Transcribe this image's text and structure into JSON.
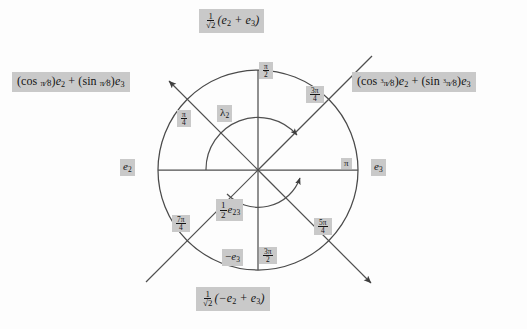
{
  "figure": {
    "type": "unit-circle-rotation-diagram",
    "center": {
      "x": 258,
      "y": 170
    },
    "radius": 100,
    "stroke_color": "#4a4a4a",
    "label_background": "#c9c9c9",
    "label_text_color": "#141414"
  },
  "outer_labels": {
    "top": {
      "text": "1/sqrt(2) (e2 + e3)",
      "coefficient_num": "1",
      "coefficient_den": "2",
      "body": "(e2 + e3)",
      "angle": "pi/4"
    },
    "left": {
      "text": "(cos pi/8)e2 + (sin pi/8)e3",
      "cos_arg": "pi/8",
      "sin_arg": "pi/8",
      "angle": "pi/8"
    },
    "right": {
      "text": "(cos 3pi/8)e2 + (sin 3pi/8)e3",
      "cos_arg": "3pi/8",
      "sin_arg": "3pi/8",
      "angle": "3pi/8"
    },
    "bottom": {
      "text": "1/sqrt(2) (-e2 + e3)",
      "coefficient_num": "1",
      "coefficient_den": "2",
      "body": "(-e2 + e3)",
      "angle": "3pi/4"
    }
  },
  "axis_labels": {
    "left_basis": "e2",
    "left_basis_sub": "2",
    "right_basis": "e3",
    "right_basis_sub": "3",
    "bottom_basis": "-e3",
    "bottom_basis_sub": "3"
  },
  "angle_ticks": [
    {
      "name": "pi-over-2",
      "num": "π",
      "den": "2",
      "degrees": 90,
      "position": "top"
    },
    {
      "name": "3pi-over-4",
      "num": "3π",
      "den": "4",
      "degrees": 135,
      "position": "upper-right"
    },
    {
      "name": "pi-over-4",
      "num": "π",
      "den": "4",
      "degrees": 45,
      "position": "upper-left"
    },
    {
      "name": "pi",
      "num": "π",
      "den": "",
      "degrees": 180,
      "position": "right"
    },
    {
      "name": "5pi-over-4",
      "num": "5π",
      "den": "4",
      "degrees": 225,
      "position": "lower-right"
    },
    {
      "name": "7pi-over-4",
      "num": "7π",
      "den": "4",
      "degrees": 315,
      "position": "lower-left"
    },
    {
      "name": "3pi-over-2",
      "num": "3π",
      "den": "2",
      "degrees": 270,
      "position": "bottom"
    }
  ],
  "inner_labels": {
    "lambda": {
      "symbol": "λ",
      "sub": "2",
      "text": "lambda_2"
    },
    "half_e23": {
      "num": "1",
      "den": "2",
      "symbol": "e",
      "sub": "23",
      "text": "(1/2) e_23"
    }
  },
  "arrows": {
    "upper_arc": {
      "name": "lambda-2-arc",
      "direction": "clockwise",
      "from_deg": 170,
      "to_deg": 55
    },
    "lower_arc": {
      "name": "half-e23-arc",
      "direction": "counterclockwise",
      "from_deg": 250,
      "to_deg": 355
    },
    "diagonal_nw": {
      "name": "pi-over-8-ray",
      "points_to": "upper-left"
    },
    "diagonal_se": {
      "name": "five-pi-over-4-ray",
      "points_to": "lower-right"
    },
    "diagonal_ne": {
      "name": "three-pi-over-8-ray",
      "points_to": "upper-right"
    },
    "diagonal_sw": {
      "name": "seven-pi-over-4-ray",
      "points_to": "lower-left"
    }
  }
}
